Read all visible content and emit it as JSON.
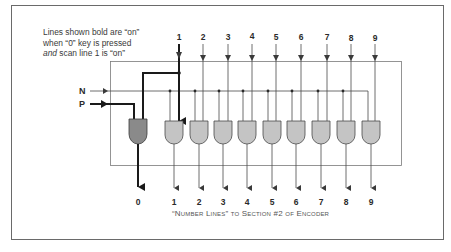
{
  "note": {
    "line1": "Lines shown bold are “on”",
    "line2": "when “0” key is pressed",
    "line3_em": "and",
    "line3_rest": " scan line 1 is “on”"
  },
  "inputs": {
    "n_label": "N",
    "p_label": "P"
  },
  "scan_lines": [
    "1",
    "2",
    "3",
    "4",
    "5",
    "6",
    "7",
    "8",
    "9"
  ],
  "outputs": [
    "0",
    "1",
    "2",
    "3",
    "4",
    "5",
    "6",
    "7",
    "8",
    "9"
  ],
  "caption": "“Number Lines” to Section #2 of Encoder",
  "colors": {
    "line": "#4a4a4a",
    "bold_line": "#1a1a1a",
    "gate_active": "#8a8a8a",
    "gate_inactive": "#c4c4c4",
    "frame": "#6a6a6a"
  }
}
